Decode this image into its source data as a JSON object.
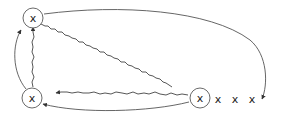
{
  "diagram": {
    "nodes": [
      {
        "id": "top-left",
        "label": "x",
        "circled": true,
        "cx": 33,
        "cy": 18
      },
      {
        "id": "bottom-left",
        "label": "x",
        "circled": true,
        "cx": 32,
        "cy": 98
      },
      {
        "id": "bottom-right",
        "label": "x",
        "circled": true,
        "cx": 200,
        "cy": 98
      },
      {
        "id": "tail-1",
        "label": "x",
        "circled": false,
        "cx": 218,
        "cy": 99
      },
      {
        "id": "tail-2",
        "label": "x",
        "circled": false,
        "cx": 235,
        "cy": 99
      },
      {
        "id": "tail-3",
        "label": "x",
        "circled": false,
        "cx": 252,
        "cy": 99
      }
    ],
    "edges": [
      {
        "from": "top-left",
        "to": "after-tail-3",
        "style": "smooth",
        "arrow": true
      },
      {
        "from": "top-left",
        "to": "bottom-right",
        "style": "wavy",
        "arrow": false
      },
      {
        "from": "bottom-right",
        "to": "bottom-left",
        "style": "wavy",
        "arrow": true
      },
      {
        "from": "bottom-right",
        "to": "bottom-left",
        "style": "smooth",
        "arrow": true
      },
      {
        "from": "bottom-left",
        "to": "top-left",
        "style": "smooth",
        "arrow": true
      },
      {
        "from": "bottom-left",
        "to": "top-left",
        "style": "wavy",
        "arrow": true
      }
    ],
    "colors": {
      "stroke": "#555555",
      "background": "#ffffff"
    }
  }
}
